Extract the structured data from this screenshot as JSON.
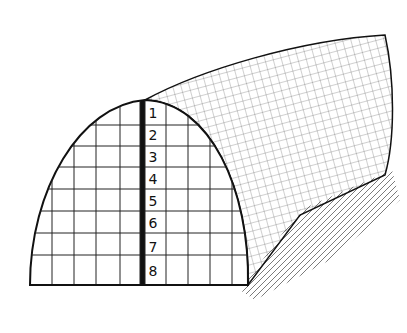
{
  "figure": {
    "row_labels": [
      "1",
      "2",
      "3",
      "4",
      "5",
      "6",
      "7",
      "8"
    ]
  }
}
